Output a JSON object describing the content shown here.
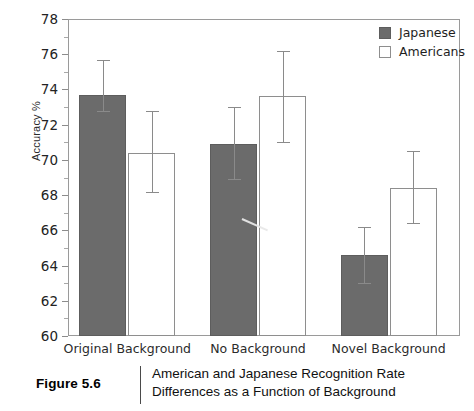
{
  "chart_data": {
    "type": "bar",
    "title": "",
    "xlabel": "",
    "ylabel": "Accuracy %",
    "ylim": [
      60,
      78
    ],
    "ytick_step": 2,
    "yticks": [
      60,
      62,
      64,
      66,
      68,
      70,
      72,
      74,
      76,
      78
    ],
    "grid": false,
    "legend_position": "top-right",
    "categories": [
      "Original Background",
      "No Background",
      "Novel Background"
    ],
    "series": [
      {
        "name": "Japanese",
        "color": "#6b6b6b",
        "fill": "solid",
        "values": [
          73.7,
          70.9,
          64.6
        ],
        "error_upper": [
          75.7,
          73.0,
          66.2
        ],
        "error_lower": [
          72.8,
          68.9,
          63.0
        ]
      },
      {
        "name": "Americans",
        "color": "#ffffff",
        "fill": "hollow",
        "values": [
          70.4,
          73.6,
          68.4
        ],
        "error_upper": [
          72.8,
          76.2,
          70.5
        ],
        "error_lower": [
          68.2,
          71.0,
          66.4
        ]
      }
    ]
  },
  "legend": {
    "items": [
      {
        "label": "Japanese",
        "swatch": "filled"
      },
      {
        "label": "Americans",
        "swatch": "hollow"
      }
    ]
  },
  "caption": {
    "figure_number": "Figure 5.6",
    "text": "American and Japanese Recognition Rate Differences as a Function of Background"
  },
  "colors": {
    "bar_filled": "#6b6b6b",
    "bar_hollow": "#ffffff",
    "axis": "#8c8c8c",
    "text": "#1a1a1a"
  }
}
